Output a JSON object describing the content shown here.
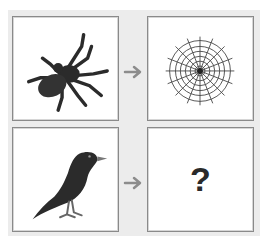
{
  "puzzle": {
    "type": "analogy",
    "pairs": [
      {
        "left": {
          "icon": "spider-icon",
          "label": "spider"
        },
        "right": {
          "icon": "spider-web-icon",
          "label": "spider web"
        }
      },
      {
        "left": {
          "icon": "bird-icon",
          "label": "bird"
        },
        "right": {
          "icon": "question-mark",
          "label": "?"
        }
      }
    ],
    "arrow_icon": "arrow-right-icon",
    "unknown_label": "?"
  },
  "colors": {
    "panel_bg": "#ececec",
    "tile_border": "#8a8a8a",
    "arrow": "#8c8c8c",
    "silhouette": "#2b2b2b"
  }
}
